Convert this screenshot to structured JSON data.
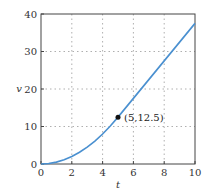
{
  "chart_data": {
    "type": "line",
    "title": "",
    "xlabel": "t",
    "ylabel": "v",
    "xlim": [
      0,
      10
    ],
    "ylim": [
      0,
      40
    ],
    "grid": true,
    "x_ticks": [
      "0",
      "2",
      "4",
      "6",
      "8",
      "10"
    ],
    "y_ticks": [
      "0",
      "10",
      "20",
      "30",
      "40"
    ],
    "series": [
      {
        "name": "v(t)",
        "color": "#4a90d0",
        "x": [
          0,
          0.5,
          1,
          1.5,
          2,
          2.5,
          3,
          3.5,
          4,
          4.5,
          5,
          6,
          7,
          8,
          9,
          10
        ],
        "values": [
          0,
          0.125,
          0.5,
          1.125,
          2,
          3.125,
          4.5,
          6.125,
          8,
          10.125,
          12.5,
          17.5,
          22.5,
          27.5,
          32.5,
          37.5
        ]
      }
    ],
    "annotations": [
      {
        "x": 5,
        "y": 12.5,
        "label": "(5,12.5)",
        "marker": "dot"
      }
    ]
  }
}
